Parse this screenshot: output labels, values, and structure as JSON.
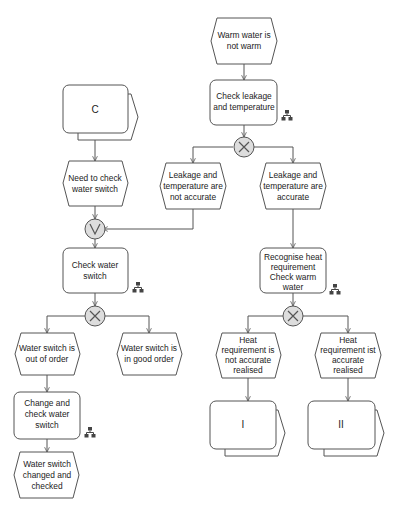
{
  "diagram": {
    "type": "EPC (event-driven process chain)",
    "colors": {
      "stroke": "#555555",
      "fill": "#ffffff",
      "gateway_fill": "#dddddd",
      "text": "#222222"
    },
    "events": [
      {
        "id": "e1",
        "lines": [
          "Warm water is",
          "not warm"
        ]
      },
      {
        "id": "e2",
        "lines": [
          "Leakage and",
          "temperature are",
          "not accurate"
        ]
      },
      {
        "id": "e3",
        "lines": [
          "Leakage and",
          "temperature are",
          "accurate"
        ]
      },
      {
        "id": "e4",
        "lines": [
          "Need to check",
          "water switch"
        ]
      },
      {
        "id": "e5",
        "lines": [
          "Water switch is",
          "out of order"
        ]
      },
      {
        "id": "e6",
        "lines": [
          "Water switch is",
          "in good order"
        ]
      },
      {
        "id": "e7",
        "lines": [
          "Water switch",
          "changed and",
          "checked"
        ]
      },
      {
        "id": "e8",
        "lines": [
          "Heat",
          "requirement is",
          "not accurate",
          "realised"
        ]
      },
      {
        "id": "e9",
        "lines": [
          "Heat",
          "requirement ist",
          "accurate",
          "realised"
        ]
      }
    ],
    "functions": [
      {
        "id": "f1",
        "lines": [
          "Check leakage",
          "and temperature"
        ],
        "has_org_icon": true
      },
      {
        "id": "f2",
        "lines": [
          "Check water",
          "switch"
        ],
        "has_org_icon": true
      },
      {
        "id": "f3",
        "lines": [
          "Change and",
          "check water",
          "switch"
        ],
        "has_org_icon": true
      },
      {
        "id": "f4",
        "lines": [
          "Recognise heat",
          "requirement",
          "Check warm",
          "water"
        ],
        "has_org_icon": true
      }
    ],
    "process_interfaces": [
      {
        "id": "p1",
        "label": "C"
      },
      {
        "id": "p2",
        "label": "I"
      },
      {
        "id": "p3",
        "label": "II"
      }
    ],
    "gateways": [
      {
        "id": "g1",
        "type": "XOR",
        "symbol": "×"
      },
      {
        "id": "g2",
        "type": "OR",
        "symbol": "∨"
      },
      {
        "id": "g3",
        "type": "XOR",
        "symbol": "×"
      },
      {
        "id": "g4",
        "type": "XOR",
        "symbol": "×"
      }
    ],
    "icons": {
      "org_icon": "hierarchy-icon"
    }
  }
}
